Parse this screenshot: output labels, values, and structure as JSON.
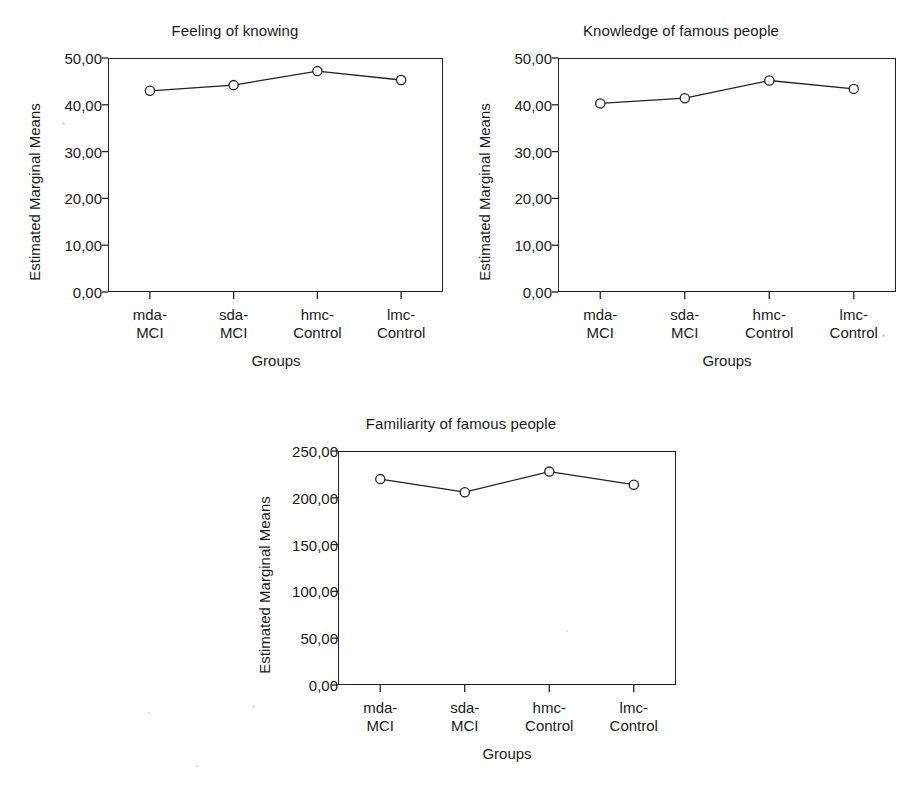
{
  "figure": {
    "background": "#ffffff",
    "line_color": "#222222",
    "marker": "open-circle",
    "xlabel": "Groups",
    "ylabel": "Estimated Marginal Means",
    "categories": [
      "mda-\nMCI",
      "sda-\nMCI",
      "hmc-\nControl",
      "lmc-\nControl"
    ]
  },
  "chart_data": [
    {
      "type": "line",
      "title": "Feeling of knowing",
      "xlabel": "Groups",
      "ylabel": "Estimated Marginal Means",
      "categories": [
        "mda-MCI",
        "sda-MCI",
        "hmc-Control",
        "lmc-Control"
      ],
      "category_lines": [
        [
          "mda-",
          "MCI"
        ],
        [
          "sda-",
          "MCI"
        ],
        [
          "hmc-",
          "Control"
        ],
        [
          "lmc-",
          "Control"
        ]
      ],
      "values": [
        43.0,
        44.2,
        47.2,
        45.3
      ],
      "ylim": [
        0,
        50
      ],
      "yticks": [
        0,
        10,
        20,
        30,
        40,
        50
      ],
      "ytick_labels": [
        "0,00",
        "10,00",
        "20,00",
        "30,00",
        "40,00",
        "50,00"
      ],
      "grid": false,
      "legend": "none"
    },
    {
      "type": "line",
      "title": "Knowledge of famous people",
      "xlabel": "Groups",
      "ylabel": "Estimated Marginal Means",
      "categories": [
        "mda-MCI",
        "sda-MCI",
        "hmc-Control",
        "lmc-Control"
      ],
      "category_lines": [
        [
          "mda-",
          "MCI"
        ],
        [
          "sda-",
          "MCI"
        ],
        [
          "hmc-",
          "Control"
        ],
        [
          "lmc-",
          "Control"
        ]
      ],
      "values": [
        40.3,
        41.4,
        45.2,
        43.4
      ],
      "ylim": [
        0,
        50
      ],
      "yticks": [
        0,
        10,
        20,
        30,
        40,
        50
      ],
      "ytick_labels": [
        "0,00",
        "10,00",
        "20,00",
        "30,00",
        "40,00",
        "50,00"
      ],
      "grid": false,
      "legend": "none"
    },
    {
      "type": "line",
      "title": "Familiarity of famous people",
      "xlabel": "Groups",
      "ylabel": "Estimated Marginal Means",
      "categories": [
        "mda-MCI",
        "sda-MCI",
        "hmc-Control",
        "lmc-Control"
      ],
      "category_lines": [
        [
          "mda-",
          "MCI"
        ],
        [
          "sda-",
          "MCI"
        ],
        [
          "hmc-",
          "Control"
        ],
        [
          "lmc-",
          "Control"
        ]
      ],
      "values": [
        220,
        206,
        228,
        214
      ],
      "ylim": [
        0,
        250
      ],
      "yticks": [
        0,
        50,
        100,
        150,
        200,
        250
      ],
      "ytick_labels": [
        "0,00",
        "50,00",
        "100,00",
        "150,00",
        "200,00",
        "250,00"
      ],
      "grid": false,
      "legend": "none"
    }
  ]
}
